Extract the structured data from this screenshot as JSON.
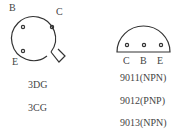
{
  "diagram": {
    "metal_can_package": {
      "pins": [
        {
          "label": "B"
        },
        {
          "label": "C"
        },
        {
          "label": "E"
        }
      ],
      "models": [
        "3DG",
        "3CG"
      ]
    },
    "to92_package": {
      "pins": [
        {
          "label": "C"
        },
        {
          "label": "B"
        },
        {
          "label": "E"
        }
      ],
      "models": [
        "9011(NPN)",
        "9012(PNP)",
        "9013(NPN)"
      ]
    }
  }
}
